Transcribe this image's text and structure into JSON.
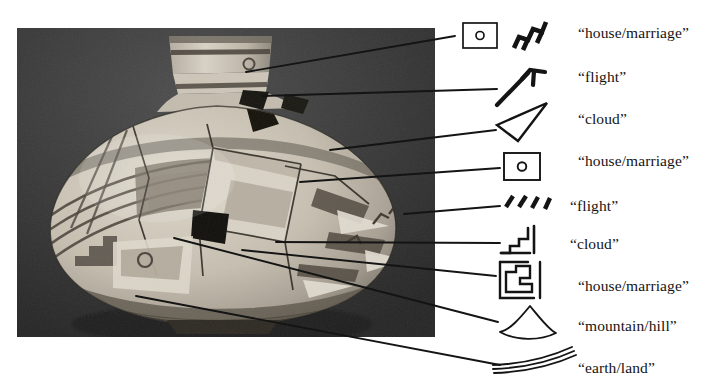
{
  "figure": {
    "type": "annotated-photograph-diagram",
    "background_color": "#ffffff",
    "ink_color": "#141414"
  },
  "photo": {
    "alt_name": "ceramic-vessel-photograph",
    "tone": "grayscale",
    "background_color": "#3a3a3a",
    "vessel_body_color": "#cfc7b8",
    "paint_color": "#4a443c",
    "x": 17,
    "y": 28,
    "width": 418,
    "height": 309
  },
  "callouts": [
    {
      "id": 1,
      "label": "“house/marriage”",
      "glyph": "rectangle-with-dot-and-tilted-fret",
      "label_x": 578,
      "label_y": 24
    },
    {
      "id": 2,
      "label": "“flight”",
      "glyph": "angled-stroke-with-flag",
      "label_x": 578,
      "label_y": 68
    },
    {
      "id": 3,
      "label": "“cloud”",
      "glyph": "narrow-wedge-triangle",
      "label_x": 578,
      "label_y": 110
    },
    {
      "id": 4,
      "label": "“house/marriage”",
      "glyph": "rectangle-with-dot",
      "label_x": 578,
      "label_y": 152
    },
    {
      "id": 5,
      "label": "“flight”",
      "glyph": "four-slanted-ticks",
      "label_x": 570,
      "label_y": 197
    },
    {
      "id": 6,
      "label": "“cloud”",
      "glyph": "stepped-stair-with-bar",
      "label_x": 570,
      "label_y": 235
    },
    {
      "id": 7,
      "label": "“house/marriage”",
      "glyph": "squared-spiral-fret",
      "label_x": 578,
      "label_y": 277
    },
    {
      "id": 8,
      "label": "“mountain/hill”",
      "glyph": "fan-hill",
      "label_x": 578,
      "label_y": 317
    },
    {
      "id": 9,
      "label": "“earth/land”",
      "glyph": "three-stacked-curves",
      "label_x": 578,
      "label_y": 359
    }
  ],
  "leader_lines": {
    "count": 9,
    "color": "#141414",
    "description": "thin straight lines joining vessel surface motifs to glyph drawings"
  }
}
